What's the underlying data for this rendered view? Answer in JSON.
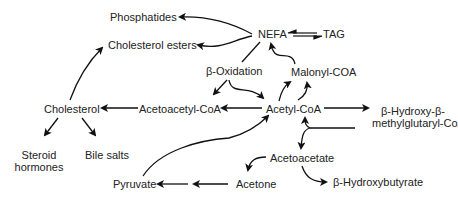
{
  "diagram": {
    "nodes": {
      "phosphatides": "Phosphatides",
      "cholesterol_esters": "Cholesterol esters",
      "nefa": "NEFA",
      "tag": "TAG",
      "beta_oxidation": "β-Oxidation",
      "malonyl_coa": "Malonyl-COA",
      "cholesterol": "Cholesterol",
      "acetoacetyl_coa": "Acetoacetyl-CoA",
      "acetyl_coa": "Acetyl-CoA",
      "hmg_coa_line1": "β-Hydroxy-β-",
      "hmg_coa_line2": "methylglutaryl-CoA",
      "steroid_hormones_line1": "Steroid",
      "steroid_hormones_line2": "hormones",
      "bile_salts": "Bile salts",
      "acetoacetate": "Acetoacetate",
      "pyruvate": "Pyruvate",
      "acetone": "Acetone",
      "beta_hydroxybutyrate": "β-Hydroxybutyrate"
    },
    "edges": [
      {
        "from": "NEFA",
        "to": "Phosphatides"
      },
      {
        "from": "NEFA",
        "to": "Cholesterol esters"
      },
      {
        "from": "NEFA",
        "to": "TAG",
        "type": "reversible"
      },
      {
        "from": "NEFA",
        "to": "β-Oxidation",
        "type": "line"
      },
      {
        "from": "β-Oxidation",
        "to": "Acetoacetyl-CoA"
      },
      {
        "from": "β-Oxidation",
        "to": "Acetyl-CoA"
      },
      {
        "from": "Acetyl-CoA",
        "to": "Malonyl-COA"
      },
      {
        "from": "Malonyl-COA",
        "to": "NEFA"
      },
      {
        "from": "Acetyl-CoA",
        "to": "Acetoacetyl-CoA"
      },
      {
        "from": "Acetoacetyl-CoA",
        "to": "Cholesterol"
      },
      {
        "from": "Cholesterol",
        "to": "Cholesterol esters"
      },
      {
        "from": "Cholesterol",
        "to": "Steroid hormones"
      },
      {
        "from": "Cholesterol",
        "to": "Bile salts"
      },
      {
        "from": "Acetyl-CoA",
        "to": "β-Hydroxy-β-methylglutaryl-CoA"
      },
      {
        "from": "β-Hydroxy-β-methylglutaryl-CoA",
        "to": "Acetyl-CoA"
      },
      {
        "from": "β-Hydroxy-β-methylglutaryl-CoA",
        "to": "Acetoacetate"
      },
      {
        "from": "Acetoacetate",
        "to": "Acetone"
      },
      {
        "from": "Acetoacetate",
        "to": "β-Hydroxybutyrate"
      },
      {
        "from": "Acetone",
        "to": "Pyruvate"
      },
      {
        "from": "Pyruvate",
        "to": "Acetyl-CoA"
      }
    ]
  }
}
